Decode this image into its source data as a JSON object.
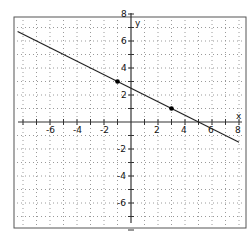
{
  "chart_data": {
    "type": "line",
    "title": "",
    "xlabel": "x",
    "ylabel": "y",
    "xlim": [
      -8,
      8
    ],
    "ylim": [
      -8,
      8
    ],
    "grid": true,
    "x_ticks": [
      -6,
      -4,
      -2,
      2,
      4,
      6,
      8
    ],
    "y_ticks": [
      8,
      6,
      4,
      2,
      -2,
      -4,
      -6
    ],
    "series": [
      {
        "name": "line",
        "equation": "y = -0.5x + 2.5",
        "x": [
          -8,
          8
        ],
        "values": [
          6.5,
          -1.5
        ]
      }
    ],
    "points": [
      {
        "x": -1,
        "y": 3
      },
      {
        "x": 3,
        "y": 1
      }
    ]
  },
  "labels": {
    "x_axis": "x",
    "y_axis": "y"
  },
  "colors": {
    "line": "#222222",
    "grid": "#9a9a9a",
    "frame": "#555555"
  }
}
